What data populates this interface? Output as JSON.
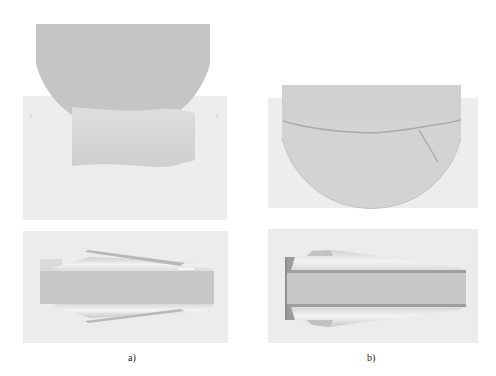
{
  "figure": {
    "panels": [
      {
        "id": "a",
        "label": "a)",
        "description": "Roll contact with cylindrical workpiece — side view (top) and cross-section view (bottom)"
      },
      {
        "id": "b",
        "label": "b)",
        "description": "Roll penetrating workpiece — side view (top) and tapered cross-section view (bottom)"
      }
    ],
    "colors": {
      "background": "#ffffff",
      "panel_bg": "#ececec",
      "roll": "#c4c4c4",
      "workpiece": "#d9d9d9",
      "core": "#c6c6c6",
      "edge": "#a9a9a9"
    }
  }
}
